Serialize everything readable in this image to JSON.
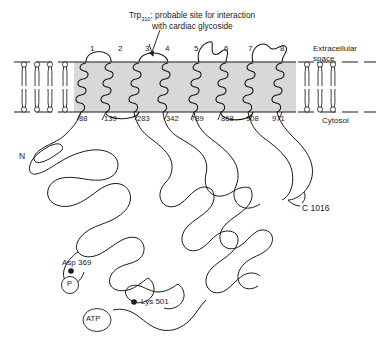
{
  "diagram": {
    "caption": {
      "prefix": "Trp",
      "subscript": "310",
      "suffix": ": probable site for interaction",
      "line2": "with cardiac glycoside"
    },
    "helix_numbers": [
      "1",
      "2",
      "3",
      "4",
      "5",
      "6",
      "7",
      "8"
    ],
    "residue_numbers": [
      "88",
      "139",
      "283",
      "342",
      "789",
      "868",
      "908",
      "971"
    ],
    "compartments": {
      "top_line1": "Extracellular",
      "top_line2": "space",
      "bottom": "Cytosol"
    },
    "termini": {
      "n_terminus": "N",
      "c_terminus": "C 1016"
    },
    "sites": [
      {
        "label": "Asp 369",
        "badge": "P"
      },
      {
        "label": "Lys 501",
        "badge": "ATP"
      }
    ],
    "colors": {
      "stroke": "#1a1a1a",
      "membrane_fill": "#d8d8d8",
      "background": "#ffffff"
    }
  }
}
